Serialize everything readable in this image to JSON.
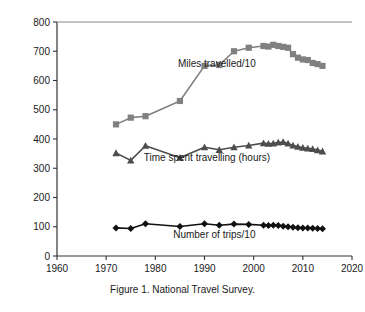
{
  "caption": "Figure 1.  National Travel Survey.",
  "chart_data": {
    "type": "line",
    "title": "",
    "xlabel": "",
    "ylabel": "",
    "xlim": [
      1960,
      2020
    ],
    "ylim": [
      0,
      800
    ],
    "xticks": [
      1960,
      1970,
      1980,
      1990,
      2000,
      2010,
      2020
    ],
    "yticks": [
      0,
      100,
      200,
      300,
      400,
      500,
      600,
      700,
      800
    ],
    "grid": false,
    "legend": "inline-annotations",
    "series": [
      {
        "name": "Miles travelled/10",
        "label": "Miles travelled/10",
        "color": "#808080",
        "marker": "square",
        "label_x": 1992.5,
        "label_y": 645,
        "x": [
          1972,
          1975,
          1978,
          1985,
          1990,
          1993,
          1996,
          1999,
          2002,
          2003,
          2004,
          2005,
          2006,
          2007,
          2008,
          2009,
          2010,
          2011,
          2012,
          2013,
          2014
        ],
        "y": [
          450,
          473,
          478,
          530,
          650,
          653,
          700,
          712,
          718,
          716,
          722,
          718,
          715,
          712,
          690,
          678,
          672,
          670,
          660,
          656,
          650
        ]
      },
      {
        "name": "Time spent travelling (hours)",
        "label": "Time spent travelling (hours)",
        "color": "#4d4d4d",
        "marker": "triangle",
        "label_x": 1990.5,
        "label_y": 325,
        "x": [
          1972,
          1975,
          1978,
          1985,
          1990,
          1993,
          1996,
          1999,
          2002,
          2003,
          2004,
          2005,
          2006,
          2007,
          2008,
          2009,
          2010,
          2011,
          2012,
          2013,
          2014
        ],
        "y": [
          352,
          327,
          377,
          336,
          372,
          363,
          372,
          378,
          386,
          384,
          385,
          388,
          390,
          385,
          378,
          374,
          370,
          368,
          366,
          362,
          358
        ]
      },
      {
        "name": "Number of trips/10",
        "label": "Number of trips/10",
        "color": "#111111",
        "marker": "diamond",
        "label_x": 1992.0,
        "label_y": 60,
        "x": [
          1972,
          1975,
          1978,
          1985,
          1990,
          1993,
          1996,
          1999,
          2002,
          2003,
          2004,
          2005,
          2006,
          2007,
          2008,
          2009,
          2010,
          2011,
          2012,
          2013,
          2014
        ],
        "y": [
          96,
          94,
          110,
          101,
          110,
          105,
          109,
          108,
          105,
          104,
          105,
          104,
          102,
          100,
          98,
          97,
          96,
          96,
          95,
          94,
          93
        ]
      }
    ]
  }
}
